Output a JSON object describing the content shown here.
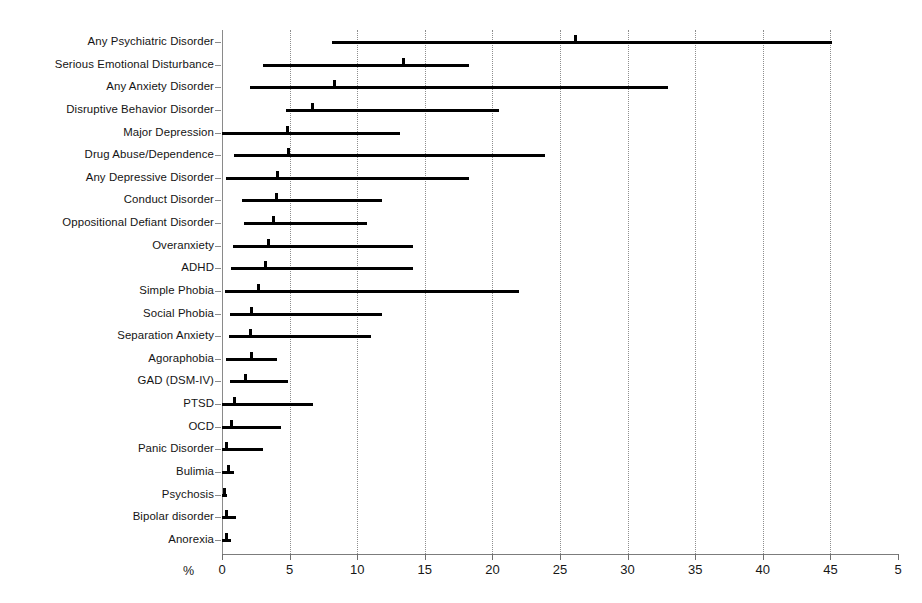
{
  "chart_data": {
    "type": "bar",
    "subtype": "range-bar-with-median-marker",
    "title": "",
    "xlabel": "%",
    "ylabel": "",
    "xlim": [
      0,
      50
    ],
    "xticks": [
      0,
      5,
      10,
      15,
      20,
      25,
      30,
      35,
      40,
      45,
      50
    ],
    "xtick_labels": [
      "0",
      "5",
      "10",
      "15",
      "20",
      "25",
      "30",
      "35",
      "40",
      "45",
      "5"
    ],
    "grid": "vertical dotted gridlines at every 5%",
    "legend": "none",
    "categories": [
      "Any Psychiatric Disorder",
      "Serious Emotional Disturbance",
      "Any Anxiety Disorder",
      "Disruptive Behavior Disorder",
      "Major Depression",
      "Drug Abuse/Dependence",
      "Any Depressive Disorder",
      "Conduct Disorder",
      "Oppositional Defiant Disorder",
      "Overanxiety",
      "ADHD",
      "Simple Phobia",
      "Social Phobia",
      "Separation Anxiety",
      "Agoraphobia",
      "GAD (DSM-IV)",
      "PTSD",
      "OCD",
      "Panic Disorder",
      "Bulimia",
      "Psychosis",
      "Bipolar disorder",
      "Anorexia"
    ],
    "series": [
      {
        "name": "Prevalence range (low)",
        "values": [
          8.1,
          3.0,
          2.1,
          4.7,
          0.0,
          0.9,
          0.3,
          1.5,
          1.6,
          0.8,
          0.7,
          0.2,
          0.6,
          0.5,
          0.3,
          0.6,
          0.0,
          0.0,
          0.0,
          0.0,
          0.0,
          0.0,
          0.0
        ]
      },
      {
        "name": "Prevalence range (high)",
        "values": [
          45.1,
          18.3,
          33.0,
          20.5,
          13.2,
          23.9,
          18.3,
          11.8,
          10.7,
          14.1,
          14.1,
          22.0,
          11.8,
          11.0,
          4.1,
          4.9,
          6.7,
          4.4,
          3.0,
          0.9,
          0.4,
          1.0,
          0.7
        ]
      },
      {
        "name": "Median estimate",
        "values": [
          26.0,
          13.3,
          8.2,
          6.6,
          4.7,
          4.8,
          4.0,
          3.9,
          3.7,
          3.3,
          3.1,
          2.6,
          2.1,
          2.0,
          2.1,
          1.6,
          0.8,
          0.6,
          0.2,
          0.4,
          0.1,
          0.2,
          0.2
        ]
      }
    ]
  },
  "axis": {
    "x_unit_label": "%",
    "x_tick_labels": [
      "0",
      "5",
      "10",
      "15",
      "20",
      "25",
      "30",
      "35",
      "40",
      "45",
      "5"
    ]
  }
}
